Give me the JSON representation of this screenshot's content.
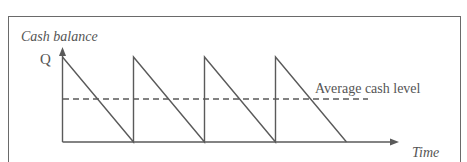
{
  "diagram": {
    "y_axis_label": "Cash balance",
    "x_axis_label": "Time",
    "peak_label": "Q",
    "average_label": "Average cash level",
    "cycles": 4,
    "line_color": "#5a5a5a"
  }
}
